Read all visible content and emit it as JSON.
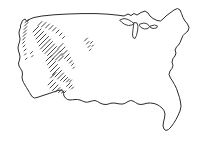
{
  "figure": {
    "style": "hand-drawn pen sketch",
    "background_color": "#ffffff",
    "line_color": "#2b2b2b",
    "hatch_color": "#3a3a3a",
    "canvas": {
      "width": 207,
      "height": 145
    }
  },
  "regions": [
    {
      "name": "contiguous-united-states",
      "label": "Contiguous United States",
      "fill": "#ffffff",
      "stroke": "#2b2b2b"
    },
    {
      "name": "hatched-western-region",
      "label": "Hatched western region",
      "pattern": "diagonal-hatch",
      "hatch_direction": "lower-left to upper-right",
      "density": "dense northwest, sparse toward center-east",
      "stroke": "#3a3a3a"
    },
    {
      "name": "great-lakes",
      "label": "Great Lakes",
      "fill": "#ffffff",
      "stroke": "#2b2b2b"
    }
  ],
  "chart_data": {
    "type": "map",
    "projection": "freehand sketch",
    "features": [
      {
        "name": "northern-border",
        "label": "Canada border"
      },
      {
        "name": "pacific-coast",
        "label": "Pacific coast"
      },
      {
        "name": "southern-border",
        "label": "Mexico border"
      },
      {
        "name": "gulf-coast",
        "label": "Gulf of Mexico coast"
      },
      {
        "name": "florida-peninsula",
        "label": "Florida peninsula"
      },
      {
        "name": "atlantic-coast",
        "label": "Atlantic coast"
      },
      {
        "name": "new-england",
        "label": "New England / Maine"
      },
      {
        "name": "lake-michigan",
        "label": "Lake Michigan"
      },
      {
        "name": "lake-superior",
        "label": "Lake Superior"
      },
      {
        "name": "lake-erie-ontario",
        "label": "Lake Erie and Ontario"
      }
    ],
    "shaded_area": {
      "label": "Western hatched area",
      "covers": [
        "Pacific Northwest",
        "Northern Rockies",
        "Great Basin",
        "Mountain West"
      ]
    }
  },
  "country_path": "M20.5,25.5 L22.5,20.5 L25.0,19.0 L27.0,21.5 L30.0,19.0 L34.0,17.5 L42.0,16.0 L54.0,14.8 L68.0,14.0 L82.0,13.6 L96.0,13.6 L108.0,14.2 L118.0,15.2 L124.0,16.0 L128.0,14.0 L131.0,15.5 L134.0,13.5 L137.0,15.0 L141.0,12.5 L145.0,11.0 L148.0,13.0 L150.0,16.0 L153.0,18.5 L157.0,20.5 L160.5,21.0 L163.0,19.0 L166.0,16.0 L170.0,13.0 L174.0,10.0 L177.5,8.5 L180.0,10.0 L181.5,13.5 L183.0,17.5 L185.0,21.0 L187.5,24.0 L189.0,27.5 L188.0,31.0 L185.5,33.0 L183.0,35.5 L181.5,39.0 L180.0,42.5 L178.5,45.0 L176.5,47.0 L175.0,50.0 L176.0,53.0 L175.0,56.0 L173.0,58.5 L172.0,62.0 L173.0,65.5 L172.0,68.5 L170.0,71.0 L169.0,74.5 L170.5,78.0 L172.5,81.0 L174.5,84.5 L176.5,88.5 L178.0,93.0 L179.5,97.5 L180.5,102.0 L181.0,106.5 L180.0,111.0 L178.0,115.5 L176.0,119.5 L173.5,123.5 L171.0,127.0 L168.5,129.5 L166.0,130.5 L164.0,129.0 L163.0,126.0 L163.5,122.0 L164.5,118.0 L165.0,114.0 L164.0,110.5 L162.0,108.0 L159.5,106.0 L157.0,104.5 L154.0,103.5 L150.5,103.0 L147.0,103.2 L144.0,104.0 L141.0,104.5 L138.0,104.0 L135.5,102.5 L133.0,101.0 L130.5,100.5 L128.0,101.5 L125.5,103.0 L123.0,104.0 L120.0,104.0 L117.0,103.5 L114.0,103.0 L111.0,103.2 L108.5,104.0 L106.0,104.5 L103.0,104.2 L100.0,103.0 L97.5,101.5 L95.0,100.5 L92.5,100.8 L90.0,101.5 L87.5,102.2 L85.0,102.0 L82.5,101.0 L80.0,100.0 L77.5,99.5 L75.0,99.5 L72.5,99.8 L70.0,100.0 L67.5,99.5 L65.5,98.0 L64.0,96.0 L63.5,93.5 L63.0,91.0 L61.0,90.0 L58.0,90.5 L55.0,91.5 L52.0,92.5 L49.0,93.5 L46.0,94.5 L43.0,95.5 L40.0,96.5 L37.0,97.5 L34.5,98.0 L32.5,97.0 L31.0,95.0 L29.5,92.5 L28.0,90.0 L26.5,87.5 L25.0,85.0 L23.5,82.5 L22.5,80.0 L22.0,77.0 L22.5,74.0 L22.0,71.0 L20.5,68.5 L19.0,66.0 L18.5,63.0 L19.5,60.0 L20.0,57.0 L19.5,54.0 L18.5,51.0 L18.0,48.0 L18.5,45.0 L19.5,42.0 L20.0,39.0 L19.5,36.0 L19.0,33.0 L19.5,30.0 L20.5,27.5 Z",
  "lake_paths": [
    "M120.0,20.0 L124.0,18.5 L128.0,19.5 L131.5,21.5 L134.0,23.5 L132.0,25.0 L128.5,25.5 L125.0,24.5 L122.0,22.5 Z",
    "M134.5,22.5 L137.0,23.0 L138.0,26.5 L137.5,31.0 L136.5,35.5 L135.0,38.5 L133.0,37.5 L132.5,34.0 L133.0,29.5 L133.5,25.5 Z",
    "M140.0,24.0 L144.0,23.0 L147.5,24.0 L149.5,26.5 L148.0,28.5 L144.5,29.0 L141.0,27.5 L139.5,25.5 Z",
    "M150.5,26.0 L154.5,25.0 L157.5,26.0 L156.5,28.0 L153.0,28.5 L150.5,27.5 Z"
  ],
  "hatch_lines": [
    [
      25.0,
      22.5,
      28.5,
      19.5
    ],
    [
      24.5,
      26.0,
      28.0,
      22.5
    ],
    [
      24.0,
      29.5,
      27.0,
      26.5
    ],
    [
      23.5,
      33.0,
      26.5,
      30.0
    ],
    [
      23.0,
      36.5,
      26.0,
      33.5
    ],
    [
      22.8,
      40.0,
      25.0,
      37.5
    ],
    [
      22.5,
      43.5,
      24.5,
      41.5
    ],
    [
      23.0,
      47.0,
      25.0,
      45.0
    ],
    [
      24.0,
      51.0,
      26.0,
      49.0
    ],
    [
      24.5,
      55.0,
      26.0,
      53.5
    ],
    [
      25.5,
      59.5,
      27.0,
      58.0
    ],
    [
      33.0,
      32.0,
      38.5,
      26.5
    ],
    [
      34.5,
      35.5,
      41.0,
      29.0
    ],
    [
      36.0,
      39.0,
      43.5,
      31.5
    ],
    [
      37.5,
      42.5,
      46.0,
      34.0
    ],
    [
      39.0,
      46.0,
      48.5,
      36.5
    ],
    [
      40.5,
      49.0,
      50.5,
      39.0
    ],
    [
      42.5,
      51.5,
      52.5,
      41.5
    ],
    [
      45.0,
      53.5,
      54.5,
      44.0
    ],
    [
      47.5,
      55.5,
      56.5,
      46.5
    ],
    [
      50.0,
      57.5,
      58.5,
      49.0
    ],
    [
      52.5,
      59.0,
      60.5,
      51.0
    ],
    [
      55.5,
      60.0,
      62.0,
      53.5
    ],
    [
      58.5,
      61.0,
      63.5,
      56.0
    ],
    [
      38.0,
      25.5,
      42.0,
      21.5
    ],
    [
      41.5,
      27.0,
      46.0,
      22.5
    ],
    [
      45.5,
      28.0,
      49.5,
      24.0
    ],
    [
      49.0,
      29.5,
      53.0,
      25.5
    ],
    [
      52.5,
      31.0,
      56.0,
      27.5
    ],
    [
      56.0,
      33.0,
      59.0,
      30.0
    ],
    [
      59.5,
      35.5,
      62.0,
      33.0
    ],
    [
      62.5,
      38.5,
      64.5,
      36.5
    ],
    [
      46.0,
      61.0,
      51.5,
      55.5
    ],
    [
      47.5,
      64.5,
      53.5,
      58.5
    ],
    [
      49.0,
      68.0,
      55.5,
      61.5
    ],
    [
      50.5,
      71.5,
      57.5,
      64.5
    ],
    [
      52.5,
      74.5,
      59.5,
      67.5
    ],
    [
      55.0,
      77.0,
      61.5,
      70.5
    ],
    [
      57.5,
      79.0,
      63.5,
      73.0
    ],
    [
      60.5,
      80.5,
      65.5,
      75.5
    ],
    [
      63.5,
      81.5,
      67.5,
      77.5
    ],
    [
      66.5,
      82.0,
      69.5,
      79.0
    ],
    [
      69.5,
      82.0,
      71.5,
      80.0
    ],
    [
      58.0,
      48.5,
      63.0,
      43.5
    ],
    [
      60.0,
      52.0,
      65.0,
      47.0
    ],
    [
      62.0,
      55.5,
      67.0,
      50.5
    ],
    [
      64.5,
      58.5,
      69.0,
      54.0
    ],
    [
      67.0,
      61.0,
      70.5,
      57.5
    ],
    [
      69.5,
      63.0,
      72.0,
      60.5
    ],
    [
      71.5,
      65.5,
      73.5,
      63.5
    ],
    [
      73.0,
      68.5,
      74.5,
      67.0
    ],
    [
      84.5,
      41.0,
      87.5,
      38.0
    ],
    [
      86.5,
      44.0,
      89.0,
      41.5
    ],
    [
      88.0,
      47.5,
      90.0,
      45.5
    ],
    [
      89.5,
      50.5,
      91.0,
      49.0
    ],
    [
      90.5,
      43.5,
      92.5,
      41.5
    ],
    [
      92.0,
      46.5,
      93.5,
      45.0
    ],
    [
      48.0,
      85.0,
      53.0,
      80.0
    ],
    [
      50.0,
      88.0,
      55.5,
      82.5
    ],
    [
      52.5,
      90.5,
      58.0,
      85.0
    ],
    [
      55.5,
      92.0,
      60.0,
      87.5
    ],
    [
      58.5,
      92.5,
      62.0,
      89.5
    ],
    [
      61.5,
      93.0,
      64.0,
      91.0
    ],
    [
      64.0,
      93.0,
      66.0,
      91.0
    ],
    [
      50.5,
      78.0,
      54.0,
      74.5
    ],
    [
      53.0,
      75.5,
      56.0,
      72.5
    ],
    [
      66.5,
      86.5,
      70.0,
      83.0
    ],
    [
      69.0,
      88.0,
      72.0,
      85.0
    ],
    [
      71.5,
      89.0,
      73.5,
      87.0
    ],
    [
      30.5,
      53.5,
      32.5,
      51.5
    ],
    [
      31.5,
      57.0,
      33.0,
      55.5
    ]
  ]
}
